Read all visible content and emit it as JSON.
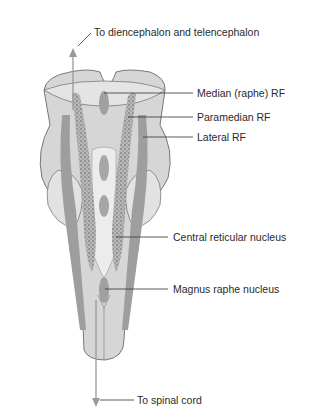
{
  "diagram": {
    "type": "anatomical-illustration",
    "labels": {
      "top_arrow": "To diencephalon and telencephalon",
      "median_rf": "Median (raphe) RF",
      "paramedian_rf": "Paramedian RF",
      "lateral_rf": "Lateral RF",
      "central_reticular": "Central reticular nucleus",
      "magnus_raphe": "Magnus raphe nucleus",
      "bottom_arrow": "To spinal cord"
    },
    "colors": {
      "outline": "#6a6a6a",
      "body_fill": "#d4d4d4",
      "light_fill": "#e6e6e6",
      "dark_band": "#9a9a9a",
      "stipple": "#555555",
      "label_text": "#2a2a2a",
      "leader_line": "#333333"
    }
  }
}
